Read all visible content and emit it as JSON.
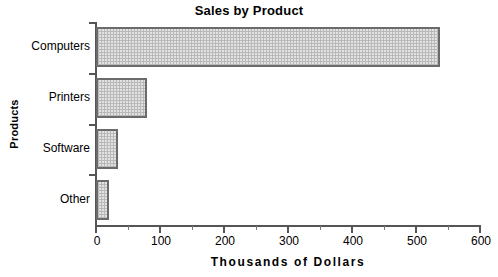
{
  "chart_data": {
    "type": "bar",
    "orientation": "horizontal",
    "title": "Sales by Product",
    "xlabel": "Thousands  of  Dollars",
    "ylabel": "Products",
    "categories": [
      "Computers",
      "Printers",
      "Software",
      "Other"
    ],
    "values": [
      537,
      80,
      34,
      21
    ],
    "xlim": [
      0,
      600
    ],
    "xticks": [
      0,
      100,
      200,
      300,
      400,
      500,
      600
    ],
    "xtick_labels": [
      "0",
      "100",
      "200",
      "300",
      "400",
      "500",
      "600"
    ],
    "xminor_ticks": [
      50,
      150,
      250,
      350,
      450,
      550
    ],
    "grid": false,
    "legend": false,
    "series": [
      {
        "name": "Sales",
        "values": [
          537,
          80,
          34,
          21
        ]
      }
    ],
    "colors": {
      "bar_fill": "#e2e2e2",
      "bar_pattern": "#b9b9b9",
      "bar_border": "#6b6b6b",
      "axis": "#555555",
      "text": "#000000",
      "background": "#ffffff"
    }
  }
}
